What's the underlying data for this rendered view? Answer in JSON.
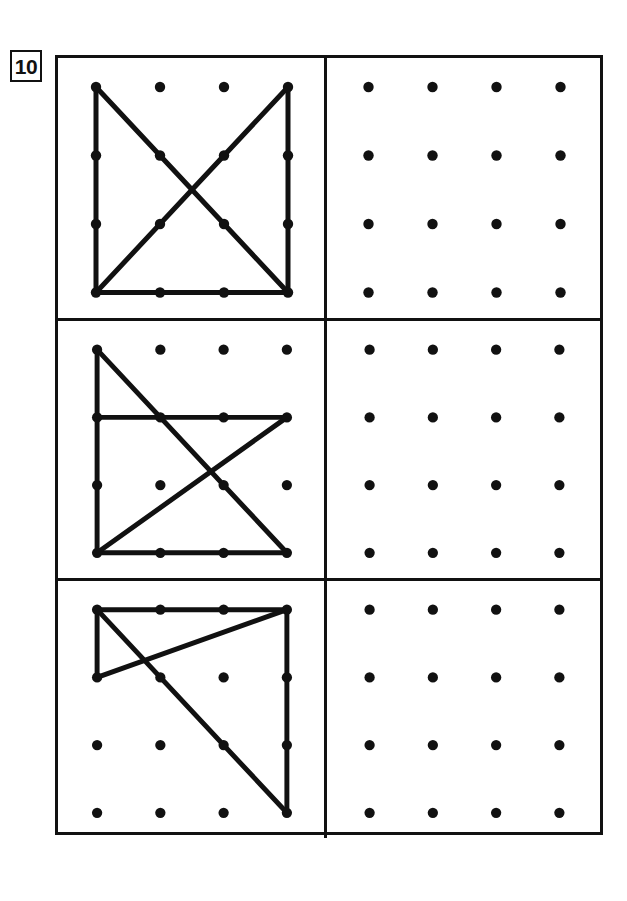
{
  "worksheet": {
    "exercise_number": "10",
    "grid_rows": 4,
    "grid_cols": 4,
    "dot_color": "#111111",
    "line_color": "#111111",
    "frame_color": "#111111",
    "background_color": "#ffffff"
  },
  "rows": [
    {
      "id": "row-1",
      "model": {
        "id": "row-1-model",
        "label": "model-figure-1",
        "segments": [
          {
            "from": [
              0,
              0
            ],
            "to": [
              0,
              3
            ],
            "name": "left-edge"
          },
          {
            "from": [
              3,
              0
            ],
            "to": [
              3,
              3
            ],
            "name": "right-edge"
          },
          {
            "from": [
              0,
              3
            ],
            "to": [
              3,
              3
            ],
            "name": "bottom-edge"
          },
          {
            "from": [
              0,
              0
            ],
            "to": [
              3,
              3
            ],
            "name": "diagonal-down"
          },
          {
            "from": [
              3,
              0
            ],
            "to": [
              0,
              3
            ],
            "name": "diagonal-up"
          }
        ]
      },
      "answer": {
        "id": "row-1-answer",
        "label": "blank-grid-1",
        "segments": []
      }
    },
    {
      "id": "row-2",
      "model": {
        "id": "row-2-model",
        "label": "model-figure-2",
        "segments": [
          {
            "from": [
              0,
              0
            ],
            "to": [
              0,
              3
            ],
            "name": "left-edge"
          },
          {
            "from": [
              0,
              1
            ],
            "to": [
              3,
              1
            ],
            "name": "middle-horizontal"
          },
          {
            "from": [
              0,
              3
            ],
            "to": [
              3,
              3
            ],
            "name": "bottom-edge"
          },
          {
            "from": [
              0,
              0
            ],
            "to": [
              3,
              3
            ],
            "name": "diagonal-down"
          },
          {
            "from": [
              0,
              3
            ],
            "to": [
              3,
              1
            ],
            "name": "diagonal-up"
          }
        ]
      },
      "answer": {
        "id": "row-2-answer",
        "label": "blank-grid-2",
        "segments": []
      }
    },
    {
      "id": "row-3",
      "model": {
        "id": "row-3-model",
        "label": "model-figure-3",
        "segments": [
          {
            "from": [
              0,
              0
            ],
            "to": [
              3,
              0
            ],
            "name": "top-edge"
          },
          {
            "from": [
              0,
              0
            ],
            "to": [
              0,
              1
            ],
            "name": "left-short-edge"
          },
          {
            "from": [
              3,
              0
            ],
            "to": [
              3,
              3
            ],
            "name": "right-edge"
          },
          {
            "from": [
              0,
              0
            ],
            "to": [
              3,
              3
            ],
            "name": "diagonal-down"
          },
          {
            "from": [
              0,
              1
            ],
            "to": [
              3,
              0
            ],
            "name": "diagonal-up"
          }
        ]
      },
      "answer": {
        "id": "row-3-answer",
        "label": "blank-grid-3",
        "segments": []
      }
    }
  ]
}
